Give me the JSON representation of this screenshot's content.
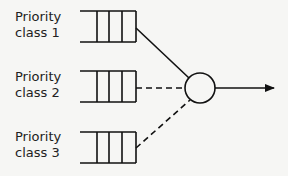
{
  "diagram": {
    "queues": [
      {
        "line1": "Priority",
        "line2": "class 1",
        "link_style": "solid"
      },
      {
        "line1": "Priority",
        "line2": "class 2",
        "link_style": "dashed"
      },
      {
        "line1": "Priority",
        "line2": "class 3",
        "link_style": "dashed"
      }
    ],
    "colors": {
      "stroke": "#111111",
      "background": "#f6f6f4"
    }
  }
}
